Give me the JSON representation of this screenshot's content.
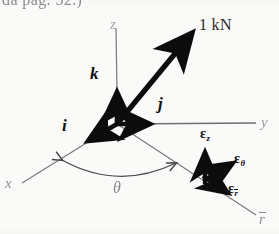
{
  "figure": {
    "caption_fragment": "da pag. 52.)",
    "ink_color": "#111111",
    "faint_ink_color": "#5d5d5d",
    "background_color": "#fbfbfa"
  },
  "axes": [
    {
      "id": "z",
      "label": "z",
      "direction": "up"
    },
    {
      "id": "y",
      "label": "y",
      "direction": "right"
    },
    {
      "id": "x",
      "label": "x",
      "direction": "lower-left"
    },
    {
      "id": "rbar",
      "label": "r",
      "overbar": true,
      "direction": "lower-right"
    }
  ],
  "unit_vectors": [
    {
      "id": "i",
      "label": "i",
      "direction": "lower-left"
    },
    {
      "id": "j",
      "label": "j",
      "direction": "right"
    },
    {
      "id": "k",
      "label": "k",
      "direction": "up"
    }
  ],
  "force_vector": {
    "label": "1 kN",
    "direction": "upper-right"
  },
  "angle": {
    "label": "θ",
    "between": "x-axis and r-axis"
  },
  "cylindrical_unit_vectors": [
    {
      "id": "eps-z",
      "symbol": "ε",
      "subscript": "z",
      "overbar": false
    },
    {
      "id": "eps-theta",
      "symbol": "ε",
      "subscript": "θ",
      "overbar": false
    },
    {
      "id": "eps-rbar",
      "symbol": "ε",
      "subscript": "r",
      "overbar": true
    }
  ]
}
